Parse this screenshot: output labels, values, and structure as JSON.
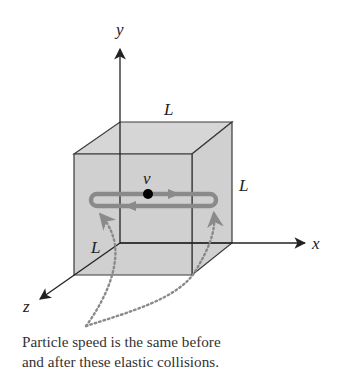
{
  "diagram": {
    "type": "particle-in-cube",
    "axes": {
      "x_label": "x",
      "y_label": "y",
      "z_label": "z"
    },
    "dimensions": {
      "top_edge_label": "L",
      "right_edge_label": "L",
      "depth_edge_label": "L"
    },
    "particle": {
      "velocity_label": "v"
    },
    "caption": {
      "line1": "Particle speed is the same before",
      "line2": "and after these elastic collisions."
    },
    "colors": {
      "cube_fill": "#cfcfcf",
      "cube_edge": "#3a3a3a",
      "path_loop": "#8a8a8a",
      "dotted_arrow": "#8a8a8a",
      "particle": "#000000",
      "axis": "#222222"
    }
  }
}
